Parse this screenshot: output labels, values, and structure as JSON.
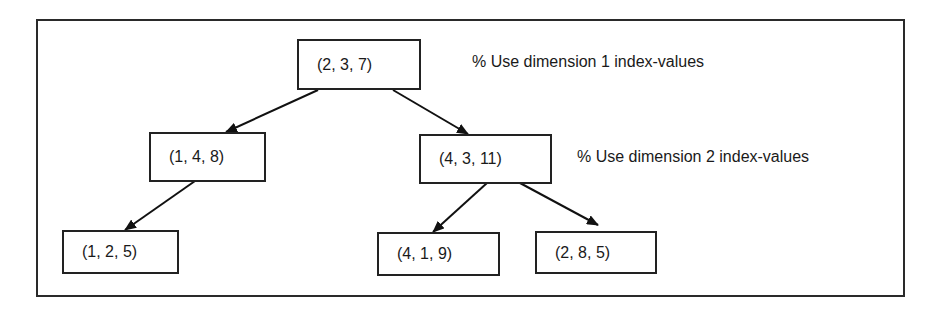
{
  "diagram": {
    "type": "kd-tree",
    "nodes": [
      {
        "id": "root",
        "label": "(2, 3, 7)",
        "level": 0
      },
      {
        "id": "l",
        "label": "(1, 4, 8)",
        "level": 1,
        "parent": "root"
      },
      {
        "id": "r",
        "label": "(4, 3, 11)",
        "level": 1,
        "parent": "root"
      },
      {
        "id": "ll",
        "label": "(1, 2, 5)",
        "level": 2,
        "parent": "l"
      },
      {
        "id": "rl",
        "label": "(4, 1, 9)",
        "level": 2,
        "parent": "r"
      },
      {
        "id": "rr",
        "label": "(2, 8, 5)",
        "level": 2,
        "parent": "r"
      }
    ],
    "annotations": [
      {
        "label": "% Use dimension 1 index-values",
        "level": 0
      },
      {
        "label": "% Use dimension 2 index-values",
        "level": 1
      }
    ]
  }
}
